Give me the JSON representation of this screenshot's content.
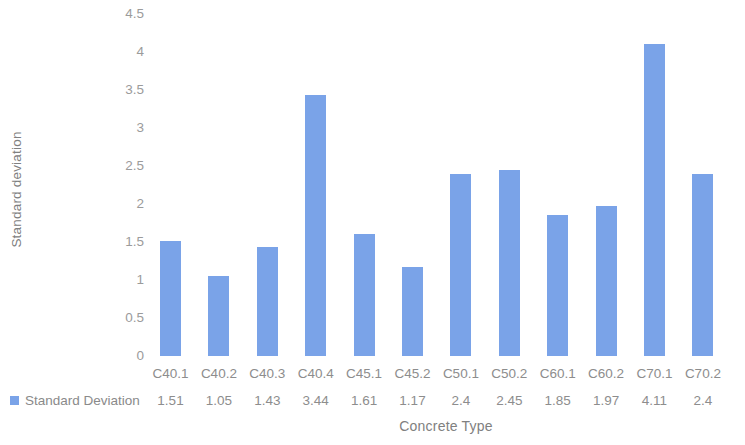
{
  "chart_data": {
    "type": "bar",
    "title": "",
    "xlabel": "Concrete Type",
    "ylabel": "Standard deviation",
    "categories": [
      "C40.1",
      "C40.2",
      "C40.3",
      "C40.4",
      "C45.1",
      "C45.2",
      "C50.1",
      "C50.2",
      "C60.1",
      "C60.2",
      "C70.1",
      "C70.2"
    ],
    "values": [
      1.51,
      1.05,
      1.43,
      3.44,
      1.61,
      1.17,
      2.4,
      2.45,
      1.85,
      1.97,
      4.11,
      2.4
    ],
    "value_labels": [
      "1.51",
      "1.05",
      "1.43",
      "3.44",
      "1.61",
      "1.17",
      "2.4",
      "2.45",
      "1.85",
      "1.97",
      "4.11",
      "2.4"
    ],
    "series": [
      {
        "name": "Standard Deviation",
        "values": [
          1.51,
          1.05,
          1.43,
          3.44,
          1.61,
          1.17,
          2.4,
          2.45,
          1.85,
          1.97,
          4.11,
          2.4
        ],
        "color": "#7aa3e8"
      }
    ],
    "ylim": [
      0,
      4.5
    ],
    "yticks": [
      0,
      0.5,
      1,
      1.5,
      2,
      2.5,
      3,
      3.5,
      4,
      4.5
    ],
    "ytick_labels": [
      "0",
      "0.5",
      "1",
      "1.5",
      "2",
      "2.5",
      "3",
      "3.5",
      "4",
      "4.5"
    ],
    "grid": false,
    "legend": {
      "position": "bottom-left-table",
      "entries": [
        {
          "label": "Standard Deviation",
          "color": "#7aa3e8"
        }
      ]
    },
    "data_table_visible": true,
    "background_color": "#ffffff",
    "axis_text_color": "#8d8d8d"
  },
  "legend_label": "Standard Deviation"
}
